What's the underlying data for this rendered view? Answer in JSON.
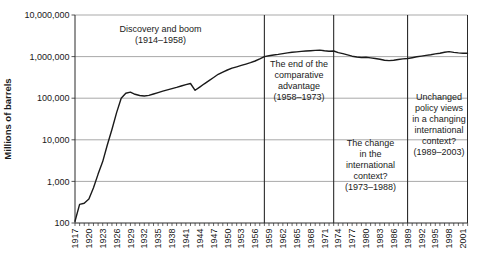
{
  "figure": {
    "background": "#ffffff",
    "curve_color": "#1a1a1a",
    "grid_color": "#848484",
    "axis_color": "#2b2b2b",
    "divider_color": "#2b2b2b",
    "text_color": "#1a1a1a"
  },
  "chart_data": {
    "type": "line",
    "title": "",
    "xlabel": "",
    "ylabel": "Millions of barrels",
    "y_scale": "log",
    "ylim": [
      100,
      10000000
    ],
    "y_ticks": [
      100,
      1000,
      10000,
      100000,
      1000000,
      10000000
    ],
    "y_tick_labels": [
      "100",
      "1,000",
      "10,000",
      "100,000",
      "1,000,000",
      "10,000,000"
    ],
    "x_range": [
      1917,
      2002
    ],
    "x_tick_years": [
      1917,
      1920,
      1923,
      1926,
      1929,
      1932,
      1935,
      1938,
      1941,
      1944,
      1947,
      1950,
      1953,
      1956,
      1959,
      1962,
      1965,
      1968,
      1971,
      1974,
      1977,
      1980,
      1983,
      1986,
      1989,
      1992,
      1995,
      1998,
      2001
    ],
    "grid": "horizontal",
    "legend": "none",
    "dividers": [
      1958,
      1973,
      1989
    ],
    "annotations": [
      {
        "id": "discovery-boom",
        "lines": [
          "Discovery and boom",
          "(1914–1958)"
        ],
        "center_year": 1935.5,
        "top": 24
      },
      {
        "id": "end-comparative-advantage",
        "lines": [
          "The end of the",
          "comparative",
          "advantage",
          "(1958–1973)"
        ],
        "center_year": 1965.5,
        "top": 59
      },
      {
        "id": "change-international-context",
        "lines": [
          "The change",
          "in the",
          "international",
          "context?",
          "(1973–1988)"
        ],
        "center_year": 1981,
        "top": 138
      },
      {
        "id": "unchanged-policy-views",
        "lines": [
          "Unchanged",
          "policy views",
          "in a changing",
          "international",
          "context?",
          "(1989–2003)"
        ],
        "center_year": 1995.8,
        "top": 92
      }
    ],
    "series": [
      {
        "name": "oil-production",
        "years": [
          1917,
          1918,
          1919,
          1920,
          1921,
          1922,
          1923,
          1924,
          1925,
          1926,
          1927,
          1928,
          1929,
          1930,
          1931,
          1932,
          1933,
          1934,
          1935,
          1936,
          1937,
          1938,
          1939,
          1940,
          1941,
          1942,
          1943,
          1944,
          1945,
          1946,
          1947,
          1948,
          1949,
          1950,
          1951,
          1952,
          1953,
          1954,
          1955,
          1956,
          1957,
          1958,
          1959,
          1960,
          1961,
          1962,
          1963,
          1964,
          1965,
          1966,
          1967,
          1968,
          1969,
          1970,
          1971,
          1972,
          1973,
          1974,
          1975,
          1976,
          1977,
          1978,
          1979,
          1980,
          1981,
          1982,
          1983,
          1984,
          1985,
          1986,
          1987,
          1988,
          1989,
          1990,
          1991,
          1992,
          1993,
          1994,
          1995,
          1996,
          1997,
          1998,
          1999,
          2000,
          2001
        ],
        "values": [
          110,
          280,
          300,
          380,
          700,
          1500,
          3000,
          7500,
          18000,
          45000,
          100000,
          132000,
          140000,
          124000,
          116000,
          113000,
          117000,
          126000,
          136000,
          147000,
          158000,
          170000,
          182000,
          196000,
          212000,
          225000,
          155000,
          185000,
          222000,
          265000,
          315000,
          375000,
          425000,
          475000,
          525000,
          570000,
          615000,
          660000,
          715000,
          785000,
          880000,
          1000000,
          1050000,
          1090000,
          1130000,
          1180000,
          1230000,
          1270000,
          1300000,
          1330000,
          1360000,
          1390000,
          1410000,
          1430000,
          1380000,
          1350000,
          1360000,
          1250000,
          1180000,
          1100000,
          1020000,
          980000,
          950000,
          960000,
          930000,
          900000,
          860000,
          820000,
          800000,
          820000,
          850000,
          880000,
          900000,
          940000,
          990000,
          1030000,
          1070000,
          1110000,
          1160000,
          1210000,
          1270000,
          1320000,
          1260000,
          1230000,
          1210000
        ]
      }
    ]
  }
}
